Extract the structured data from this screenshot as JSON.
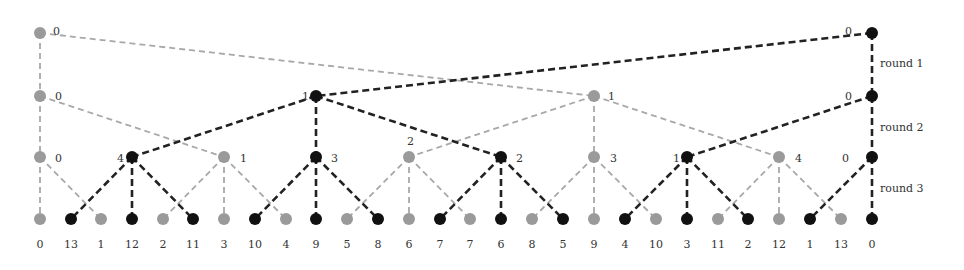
{
  "colors": {
    "gray": "#9a9a9a",
    "black": "#111111",
    "gray_edge": "#a8a8a8",
    "black_edge": "#222222"
  },
  "rounds": [
    {
      "label": "round 1",
      "x": 880,
      "y": 67
    },
    {
      "label": "round 2",
      "x": 880,
      "y": 131
    },
    {
      "label": "round 3",
      "x": 880,
      "y": 192
    }
  ],
  "levels_y": [
    33,
    96,
    157,
    219
  ],
  "nodes": {
    "level0": [
      {
        "id": "g0_0",
        "x": 40,
        "color": "gray",
        "label": "0",
        "lx": 53,
        "ly": 31
      },
      {
        "id": "b0_0",
        "x": 872,
        "color": "black",
        "label": "0",
        "lx": 845,
        "ly": 31
      }
    ],
    "level1": [
      {
        "id": "g1_0",
        "x": 40,
        "color": "gray",
        "label": "0",
        "lx": 55,
        "ly": 96
      },
      {
        "id": "b1_0",
        "x": 316,
        "color": "black",
        "label": "1",
        "lx": 302,
        "ly": 96
      },
      {
        "id": "g1_1",
        "x": 594,
        "color": "gray",
        "label": "1",
        "lx": 608,
        "ly": 96
      },
      {
        "id": "b1_1",
        "x": 872,
        "color": "black",
        "label": "0",
        "lx": 845,
        "ly": 96
      }
    ],
    "level2": [
      {
        "id": "g2_0",
        "x": 40,
        "color": "gray",
        "label": "0",
        "lx": 55,
        "ly": 158
      },
      {
        "id": "b2_0",
        "x": 132,
        "color": "black",
        "label": "4",
        "lx": 117,
        "ly": 158
      },
      {
        "id": "g2_1",
        "x": 224,
        "color": "gray",
        "label": "1",
        "lx": 240,
        "ly": 158
      },
      {
        "id": "b2_1",
        "x": 316,
        "color": "black",
        "label": "3",
        "lx": 331,
        "ly": 158
      },
      {
        "id": "g2_2",
        "x": 409,
        "color": "gray",
        "label": "2",
        "lx": 407,
        "ly": 141
      },
      {
        "id": "b2_2",
        "x": 501,
        "color": "black",
        "label": "2",
        "lx": 516,
        "ly": 158
      },
      {
        "id": "g2_3",
        "x": 594,
        "color": "gray",
        "label": "3",
        "lx": 610,
        "ly": 158
      },
      {
        "id": "b2_3",
        "x": 687,
        "color": "black",
        "label": "1",
        "lx": 673,
        "ly": 158
      },
      {
        "id": "g2_4",
        "x": 779,
        "color": "gray",
        "label": "4",
        "lx": 795,
        "ly": 158
      },
      {
        "id": "b2_4",
        "x": 872,
        "color": "black",
        "label": "0",
        "lx": 842,
        "ly": 158
      }
    ],
    "level3": [
      {
        "x": 40,
        "color": "gray",
        "label": "0"
      },
      {
        "x": 71,
        "color": "black",
        "label": "13"
      },
      {
        "x": 101,
        "color": "gray",
        "label": "1"
      },
      {
        "x": 132,
        "color": "black",
        "label": "12"
      },
      {
        "x": 163,
        "color": "gray",
        "label": "2"
      },
      {
        "x": 193,
        "color": "black",
        "label": "11"
      },
      {
        "x": 224,
        "color": "gray",
        "label": "3"
      },
      {
        "x": 255,
        "color": "black",
        "label": "10"
      },
      {
        "x": 286,
        "color": "gray",
        "label": "4"
      },
      {
        "x": 316,
        "color": "black",
        "label": "9"
      },
      {
        "x": 347,
        "color": "gray",
        "label": "5"
      },
      {
        "x": 378,
        "color": "black",
        "label": "8"
      },
      {
        "x": 409,
        "color": "gray",
        "label": "6"
      },
      {
        "x": 440,
        "color": "black",
        "label": "7"
      },
      {
        "x": 470,
        "color": "gray",
        "label": "7"
      },
      {
        "x": 501,
        "color": "black",
        "label": "6"
      },
      {
        "x": 532,
        "color": "gray",
        "label": "8"
      },
      {
        "x": 563,
        "color": "black",
        "label": "5"
      },
      {
        "x": 594,
        "color": "gray",
        "label": "9"
      },
      {
        "x": 625,
        "color": "black",
        "label": "4"
      },
      {
        "x": 656,
        "color": "gray",
        "label": "10"
      },
      {
        "x": 687,
        "color": "black",
        "label": "3"
      },
      {
        "x": 718,
        "color": "gray",
        "label": "11"
      },
      {
        "x": 748,
        "color": "black",
        "label": "2"
      },
      {
        "x": 779,
        "color": "gray",
        "label": "12"
      },
      {
        "x": 810,
        "color": "black",
        "label": "1"
      },
      {
        "x": 841,
        "color": "gray",
        "label": "13"
      },
      {
        "x": 872,
        "color": "black",
        "label": "0"
      }
    ]
  },
  "edges": [
    {
      "from": [
        40,
        0
      ],
      "to": [
        40,
        1
      ],
      "color": "gray"
    },
    {
      "from": [
        40,
        0
      ],
      "to": [
        594,
        1
      ],
      "color": "gray"
    },
    {
      "from": [
        872,
        0
      ],
      "to": [
        872,
        1
      ],
      "color": "black"
    },
    {
      "from": [
        872,
        0
      ],
      "to": [
        316,
        1
      ],
      "color": "black"
    },
    {
      "from": [
        40,
        1
      ],
      "to": [
        40,
        2
      ],
      "color": "gray"
    },
    {
      "from": [
        40,
        1
      ],
      "to": [
        224,
        2
      ],
      "color": "gray"
    },
    {
      "from": [
        316,
        1
      ],
      "to": [
        132,
        2
      ],
      "color": "black"
    },
    {
      "from": [
        316,
        1
      ],
      "to": [
        316,
        2
      ],
      "color": "black"
    },
    {
      "from": [
        316,
        1
      ],
      "to": [
        501,
        2
      ],
      "color": "black"
    },
    {
      "from": [
        594,
        1
      ],
      "to": [
        409,
        2
      ],
      "color": "gray"
    },
    {
      "from": [
        594,
        1
      ],
      "to": [
        594,
        2
      ],
      "color": "gray"
    },
    {
      "from": [
        594,
        1
      ],
      "to": [
        779,
        2
      ],
      "color": "gray"
    },
    {
      "from": [
        872,
        1
      ],
      "to": [
        687,
        2
      ],
      "color": "black"
    },
    {
      "from": [
        872,
        1
      ],
      "to": [
        872,
        2
      ],
      "color": "black"
    },
    {
      "from": [
        40,
        2
      ],
      "to": [
        40,
        3
      ],
      "color": "gray"
    },
    {
      "from": [
        40,
        2
      ],
      "to": [
        101,
        3
      ],
      "color": "gray"
    },
    {
      "from": [
        132,
        2
      ],
      "to": [
        71,
        3
      ],
      "color": "black"
    },
    {
      "from": [
        132,
        2
      ],
      "to": [
        132,
        3
      ],
      "color": "black"
    },
    {
      "from": [
        132,
        2
      ],
      "to": [
        193,
        3
      ],
      "color": "black"
    },
    {
      "from": [
        224,
        2
      ],
      "to": [
        163,
        3
      ],
      "color": "gray"
    },
    {
      "from": [
        224,
        2
      ],
      "to": [
        224,
        3
      ],
      "color": "gray"
    },
    {
      "from": [
        224,
        2
      ],
      "to": [
        286,
        3
      ],
      "color": "gray"
    },
    {
      "from": [
        316,
        2
      ],
      "to": [
        255,
        3
      ],
      "color": "black"
    },
    {
      "from": [
        316,
        2
      ],
      "to": [
        316,
        3
      ],
      "color": "black"
    },
    {
      "from": [
        316,
        2
      ],
      "to": [
        378,
        3
      ],
      "color": "black"
    },
    {
      "from": [
        409,
        2
      ],
      "to": [
        347,
        3
      ],
      "color": "gray"
    },
    {
      "from": [
        409,
        2
      ],
      "to": [
        409,
        3
      ],
      "color": "gray"
    },
    {
      "from": [
        409,
        2
      ],
      "to": [
        470,
        3
      ],
      "color": "gray"
    },
    {
      "from": [
        501,
        2
      ],
      "to": [
        440,
        3
      ],
      "color": "black"
    },
    {
      "from": [
        501,
        2
      ],
      "to": [
        501,
        3
      ],
      "color": "black"
    },
    {
      "from": [
        501,
        2
      ],
      "to": [
        563,
        3
      ],
      "color": "black"
    },
    {
      "from": [
        594,
        2
      ],
      "to": [
        532,
        3
      ],
      "color": "gray"
    },
    {
      "from": [
        594,
        2
      ],
      "to": [
        594,
        3
      ],
      "color": "gray"
    },
    {
      "from": [
        594,
        2
      ],
      "to": [
        656,
        3
      ],
      "color": "gray"
    },
    {
      "from": [
        687,
        2
      ],
      "to": [
        625,
        3
      ],
      "color": "black"
    },
    {
      "from": [
        687,
        2
      ],
      "to": [
        687,
        3
      ],
      "color": "black"
    },
    {
      "from": [
        687,
        2
      ],
      "to": [
        748,
        3
      ],
      "color": "black"
    },
    {
      "from": [
        779,
        2
      ],
      "to": [
        718,
        3
      ],
      "color": "gray"
    },
    {
      "from": [
        779,
        2
      ],
      "to": [
        779,
        3
      ],
      "color": "gray"
    },
    {
      "from": [
        779,
        2
      ],
      "to": [
        841,
        3
      ],
      "color": "gray"
    },
    {
      "from": [
        872,
        2
      ],
      "to": [
        810,
        3
      ],
      "color": "black"
    },
    {
      "from": [
        872,
        2
      ],
      "to": [
        872,
        3
      ],
      "color": "black"
    }
  ],
  "bottom_labels_y": 248
}
